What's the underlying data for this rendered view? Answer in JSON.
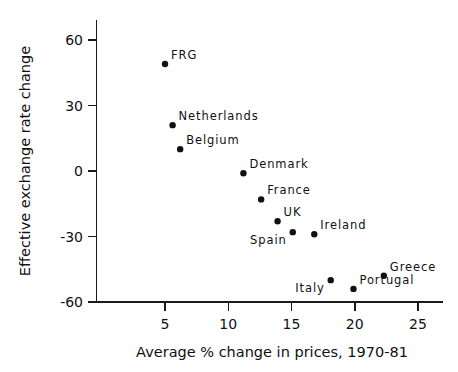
{
  "chart_data": {
    "type": "scatter",
    "title": "",
    "xlabel": "Average % change in prices, 1970-81",
    "ylabel": "Effective exchange rate change",
    "xlim": [
      2.0,
      26.3
    ],
    "ylim": [
      -60,
      68
    ],
    "grid": false,
    "legend": "none",
    "xticks": [
      "5",
      "10",
      "15",
      "20",
      "25"
    ],
    "xtick_values": [
      5,
      10,
      15,
      20,
      25
    ],
    "yticks": [
      "60",
      "30",
      "0",
      "-30",
      "-60"
    ],
    "ytick_values": [
      60,
      30,
      0,
      -30,
      -60
    ],
    "marker_color": "#111111",
    "axis_color": "#1a1a1a",
    "points": [
      {
        "label": "FRG",
        "x": 5.0,
        "y": 49,
        "label_pos": "right"
      },
      {
        "label": "Netherlands",
        "x": 5.6,
        "y": 21,
        "label_pos": "right"
      },
      {
        "label": "Belgium",
        "x": 6.2,
        "y": 10,
        "label_pos": "right"
      },
      {
        "label": "Denmark",
        "x": 11.2,
        "y": -1,
        "label_pos": "right"
      },
      {
        "label": "France",
        "x": 12.6,
        "y": -13,
        "label_pos": "right"
      },
      {
        "label": "UK",
        "x": 13.9,
        "y": -23,
        "label_pos": "right"
      },
      {
        "label": "Spain",
        "x": 15.1,
        "y": -28,
        "label_pos": "belowleft"
      },
      {
        "label": "Ireland",
        "x": 16.8,
        "y": -29,
        "label_pos": "right"
      },
      {
        "label": "Italy",
        "x": 18.1,
        "y": -50,
        "label_pos": "belowleft"
      },
      {
        "label": "Portugal",
        "x": 19.9,
        "y": -54,
        "label_pos": "right"
      },
      {
        "label": "Greece",
        "x": 22.3,
        "y": -48,
        "label_pos": "right"
      }
    ]
  },
  "axes": {
    "x_title": "Average % change in prices, 1970-81",
    "y_title": "Effective exchange rate change"
  }
}
